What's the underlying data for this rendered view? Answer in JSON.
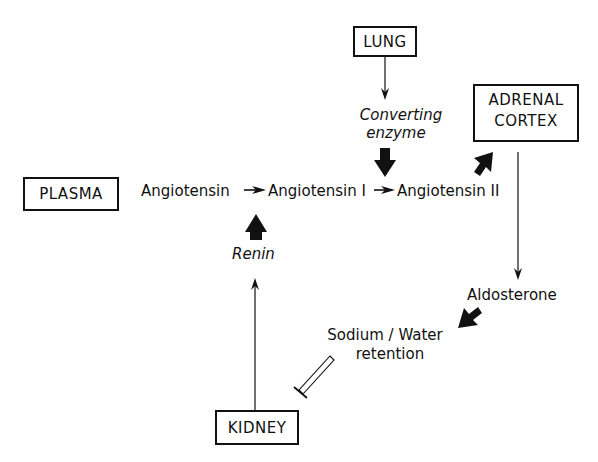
{
  "diagram": {
    "nodes": {
      "lung": "LUNG",
      "adrenal_line1": "ADRENAL",
      "adrenal_line2": "CORTEX",
      "plasma": "PLASMA",
      "kidney": "KIDNEY"
    },
    "labels": {
      "angiotensinogen": "Angiotensin",
      "angiotensin_1": "Angiotensin I",
      "angiotensin_2": "Angiotensin II",
      "converting_line1": "Converting",
      "converting_line2": "enzyme",
      "renin": "Renin",
      "aldosterone": "Aldosterone",
      "sodium_line1": "Sodium / Water",
      "sodium_line2": "retention"
    },
    "edges": [
      {
        "from": "LUNG",
        "to": "Converting enzyme",
        "type": "thin-arrow"
      },
      {
        "from": "Converting enzyme",
        "to": "Angiotensin I → Angiotensin II",
        "type": "thick-arrow"
      },
      {
        "from": "Angiotensin",
        "to": "Angiotensin I",
        "type": "small-arrow"
      },
      {
        "from": "Angiotensin I",
        "to": "Angiotensin II",
        "type": "small-arrow"
      },
      {
        "from": "Renin",
        "to": "Angiotensin → Angiotensin I",
        "type": "thick-arrow"
      },
      {
        "from": "KIDNEY",
        "to": "Renin",
        "type": "thin-arrow"
      },
      {
        "from": "Angiotensin II",
        "to": "ADRENAL CORTEX",
        "type": "thick-arrow"
      },
      {
        "from": "ADRENAL CORTEX",
        "to": "Aldosterone",
        "type": "thin-arrow"
      },
      {
        "from": "Aldosterone",
        "to": "Sodium / Water retention",
        "type": "thick-arrow"
      },
      {
        "from": "Sodium / Water retention",
        "to": "KIDNEY",
        "type": "inhibition"
      }
    ]
  }
}
